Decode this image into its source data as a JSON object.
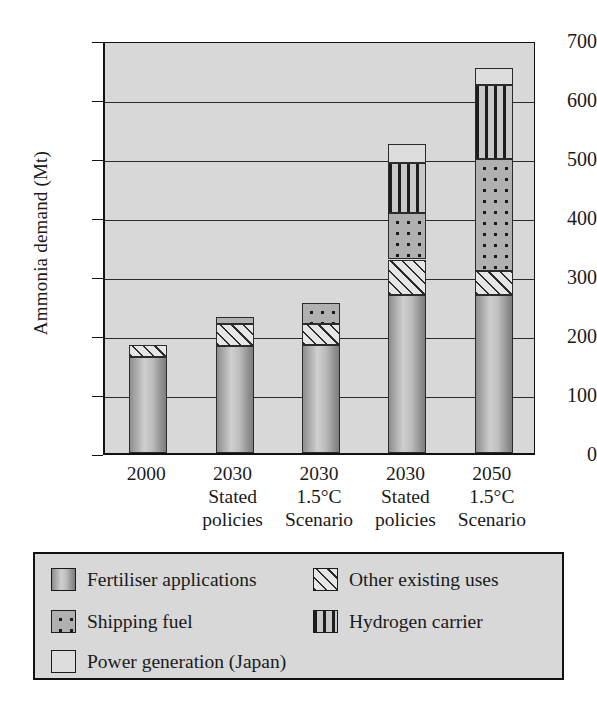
{
  "chart_data": {
    "type": "bar",
    "subtype": "stacked-bar",
    "title": "",
    "xlabel": "",
    "ylabel": "Ammonia demand (Mt)",
    "ylim": [
      0,
      700
    ],
    "yticks": [
      0,
      100,
      200,
      300,
      400,
      500,
      600,
      700
    ],
    "grid": true,
    "legend_position": "bottom",
    "categories": [
      "2000",
      "2030 Stated policies",
      "2030 1.5°C Scenario",
      "2030 Stated policies",
      "2050 1.5°C Scenario"
    ],
    "category_lines": [
      [
        "2000",
        "",
        ""
      ],
      [
        "2030",
        "Stated",
        "policies"
      ],
      [
        "2030",
        "1.5°C",
        "Scenario"
      ],
      [
        "2030",
        "Stated",
        "policies"
      ],
      [
        "2050",
        "1.5°C",
        "Scenario"
      ]
    ],
    "series": [
      {
        "name": "Fertiliser applications",
        "key": "fert",
        "values": [
          163,
          182,
          183,
          268,
          268
        ]
      },
      {
        "name": "Other existing uses",
        "key": "other",
        "values": [
          20,
          36,
          35,
          60,
          40
        ]
      },
      {
        "name": "Shipping fuel",
        "key": "ship",
        "values": [
          0,
          12,
          37,
          78,
          190
        ]
      },
      {
        "name": "Hydrogen carrier",
        "key": "hydro",
        "values": [
          0,
          0,
          0,
          85,
          125
        ]
      },
      {
        "name": "Power generation (Japan)",
        "key": "power",
        "values": [
          0,
          0,
          0,
          32,
          30
        ]
      }
    ],
    "totals": [
      183,
      230,
      255,
      523,
      653
    ],
    "bar_tops": [
      183,
      240,
      257,
      553,
      690
    ]
  },
  "legend": {
    "items": [
      {
        "label": "Fertiliser applications",
        "swatch": "fert"
      },
      {
        "label": "Other existing uses",
        "swatch": "other"
      },
      {
        "label": "Shipping fuel",
        "swatch": "ship"
      },
      {
        "label": "Hydrogen carrier",
        "swatch": "hydro"
      },
      {
        "label": "Power generation (Japan)",
        "swatch": "power"
      }
    ]
  },
  "colors": {
    "plot_background": "#d8d8d8",
    "axis": "#111111",
    "fertiliser": "#b0b0b0",
    "other_existing": "#e6e6e6",
    "shipping": "#b0b0b0",
    "hydrogen": "#c9c9c9",
    "power": "#dcdcdc"
  }
}
